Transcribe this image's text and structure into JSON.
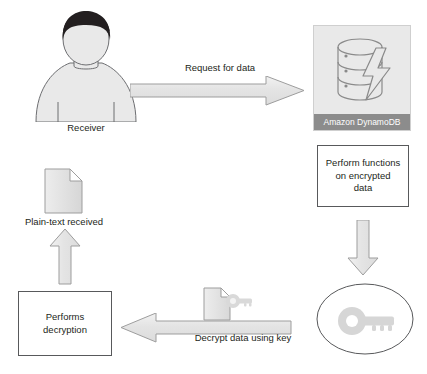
{
  "diagram": {
    "colors": {
      "arrow_fill": "#e6e6e6",
      "arrow_stroke": "#9d9d9d",
      "box_stroke": "#58595b",
      "panel_bg": "#e9e9e9",
      "panel_bar": "#8c8c8c",
      "text": "#231f20",
      "hair": "#231f20",
      "body_fill": "#e9e9e9",
      "body_stroke": "#6d6e71",
      "doc_fill": "#e6e6e6",
      "doc_stroke": "#9d9d9d",
      "key_fill": "#d9d9d9"
    },
    "nodes": {
      "receiver": {
        "icon": "person-icon",
        "label": "Receiver"
      },
      "plain_text": {
        "icon": "document-icon",
        "label": "Plain-text received"
      },
      "performs_decryption": {
        "label_line1": "Performs",
        "label_line2": "decryption"
      },
      "dynamodb": {
        "icon": "database-lightning-icon",
        "label": "Amazon DynamoDB"
      },
      "perform_functions": {
        "label_line1": "Perform functions",
        "label_line2": "on encrypted",
        "label_line3": "data"
      },
      "key_store": {
        "icon": "key-icon",
        "label": ""
      },
      "encrypted_doc": {
        "icon": "document-key-icon",
        "label": ""
      }
    },
    "arrows": {
      "request": {
        "label": "Request for data",
        "direction": "right"
      },
      "process_down": {
        "label": "",
        "direction": "down"
      },
      "decrypt": {
        "label": "Decrypt data using key",
        "direction": "left"
      },
      "return_up": {
        "label": "",
        "direction": "up"
      }
    }
  }
}
